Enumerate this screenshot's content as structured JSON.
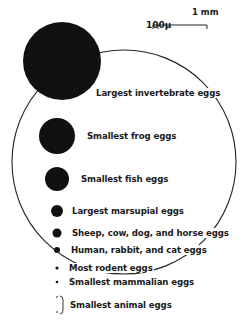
{
  "scale_bar": {
    "major_label": "1 mm",
    "minor_label": "100μ"
  },
  "eggs": [
    {
      "label": "Largest invertebrate eggs",
      "cx": 62,
      "cy": 61,
      "r": 39
    },
    {
      "label": "Smallest frog eggs",
      "cx": 57,
      "cy": 136,
      "r": 18
    },
    {
      "label": "Smallest fish eggs",
      "cx": 57,
      "cy": 179,
      "r": 12
    },
    {
      "label": "Largest marsupial eggs",
      "cx": 57,
      "cy": 211,
      "r": 6
    },
    {
      "label": "Sheep, cow, dog, and horse eggs",
      "cx": 57,
      "cy": 233,
      "r": 4.5
    },
    {
      "label": "Human, rabbit, and cat eggs",
      "cx": 57,
      "cy": 250,
      "r": 3
    },
    {
      "label": "Most rodent eggs",
      "cx": 57,
      "cy": 268,
      "r": 1.6
    },
    {
      "label": "Smallest mammalian eggs",
      "cx": 57,
      "cy": 282,
      "r": 1.3
    },
    {
      "label": "Smallest animal eggs",
      "cx": 57,
      "cy": 305,
      "r": 0.7
    }
  ],
  "colors": {
    "ink": "#111111",
    "background": "#ffffff"
  }
}
